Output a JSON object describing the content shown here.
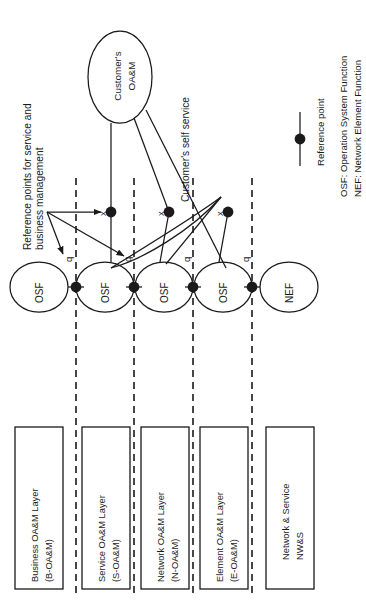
{
  "figure": {
    "type": "network-management-layer-diagram",
    "orientation": "rotated-90-ccw",
    "background": "#ffffff",
    "line_color": "#1a1a1a"
  },
  "annotations": {
    "service_business_note": "Reference points for service and\nbusiness management",
    "self_service_note": "Customer's self service"
  },
  "customer_node": {
    "label_line1": "Customer's",
    "label_line2": "OA&M",
    "shape": "ellipse"
  },
  "function_nodes": [
    {
      "label": "OSF",
      "shape": "ellipse"
    },
    {
      "label": "OSF",
      "shape": "ellipse"
    },
    {
      "label": "OSF",
      "shape": "ellipse"
    },
    {
      "label": "OSF",
      "shape": "ellipse"
    },
    {
      "label": "NEF",
      "shape": "ellipse"
    }
  ],
  "reference_points": {
    "x_points": [
      "x",
      "x",
      "x"
    ],
    "q_points": [
      "q",
      "q",
      "q",
      "q"
    ]
  },
  "layers": [
    {
      "name_line1": "Business OA&M Layer",
      "name_line2": "(B-OA&M)"
    },
    {
      "name_line1": "Service OA&M Layer",
      "name_line2": "(S-OA&M)"
    },
    {
      "name_line1": "Network OA&M Layer",
      "name_line2": "(N-OA&M)"
    },
    {
      "name_line1": "Element OA&M Layer",
      "name_line2": "(E-OA&M)"
    },
    {
      "name_line1": "Network & Service",
      "name_line2": "NW&S"
    }
  ],
  "legend": {
    "marker_label": "Reference point",
    "abbrev_osf": "OSF: Operation System Function",
    "abbrev_nef": "NEF: Network Element Function"
  }
}
